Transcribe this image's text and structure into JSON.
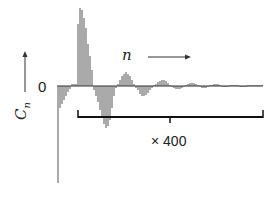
{
  "chart_data": {
    "type": "bar",
    "title": "",
    "xlabel": "n",
    "ylabel": "C_n",
    "zero_label": "0",
    "scale_annotation": "× 400",
    "annotation_note": "Bracketed tail region magnified by factor 400",
    "grid": false,
    "legend": null,
    "colors": {
      "bars": "#555555",
      "axis": "#333333",
      "bracket": "#111111"
    },
    "series": [
      {
        "name": "C_n",
        "x_px": [
          58,
          60,
          62,
          64,
          66,
          68,
          70,
          72,
          74,
          76,
          78,
          80,
          82,
          84,
          86,
          88,
          90,
          92,
          94,
          96,
          98,
          100,
          102,
          104,
          106,
          108,
          110,
          112,
          114,
          116,
          118,
          120,
          122,
          124,
          126,
          128,
          130,
          132,
          134,
          136,
          138,
          140,
          142,
          144,
          146,
          148,
          150,
          152,
          154,
          156,
          158,
          160,
          162,
          164,
          166,
          168,
          170,
          172,
          174,
          176,
          178,
          180,
          182,
          184,
          186,
          188,
          190,
          192,
          194,
          196,
          198,
          200,
          202,
          204,
          206,
          208,
          210,
          212,
          214,
          216,
          218,
          220,
          222,
          224,
          226,
          228,
          230,
          232,
          234,
          236,
          238,
          240,
          242,
          244,
          246,
          248,
          250,
          252,
          254,
          256,
          258,
          260,
          262
        ],
        "values": [
          -97,
          -22,
          -18,
          -14,
          -10,
          -6,
          -3,
          2,
          2,
          2,
          62,
          78,
          76,
          68,
          58,
          42,
          30,
          16,
          -4,
          -10,
          -16,
          -24,
          -32,
          -38,
          -42,
          -40,
          -34,
          -22,
          -10,
          -2,
          2,
          6,
          10,
          12,
          14,
          12,
          10,
          6,
          2,
          -2,
          -4,
          -8,
          -10,
          -10,
          -9,
          -7,
          -4,
          -2,
          1,
          2,
          4,
          5,
          6,
          6,
          5,
          3,
          1,
          -1,
          -2,
          -3,
          -3,
          -3,
          -2,
          -1,
          1,
          2,
          3,
          3,
          3,
          2,
          1,
          -1,
          -2,
          -2,
          -2,
          -1,
          1,
          1,
          2,
          2,
          2,
          1,
          -1,
          -1,
          -1,
          -1,
          1,
          1,
          1,
          1,
          1,
          -1,
          -1,
          -1,
          -1,
          1,
          1,
          1,
          1,
          1,
          1,
          1,
          1,
          1,
          1
        ]
      }
    ],
    "bracket": {
      "x_start_px": 78,
      "x_end_px": 263,
      "center_tick_px": 170,
      "y_px": 117
    },
    "ylim": [
      -100,
      80
    ]
  },
  "labels": {
    "zero": "0",
    "x_axis": "n",
    "y_axis_main": "C",
    "y_axis_sub": "n",
    "scale": "× 400"
  }
}
